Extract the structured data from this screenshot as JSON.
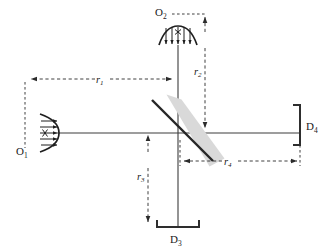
{
  "figure": {
    "background_color": "#ffffff",
    "line_color": "#3c3c3c",
    "beam_splitter_color": "#262626",
    "beam_splitter_band_color": "#d9d9d9",
    "dimension_color": "#2b2b2b"
  },
  "sources": [
    {
      "id": "source-o1",
      "label": "O",
      "subscript": "1",
      "position": "left",
      "emits": "right",
      "marker": "x"
    },
    {
      "id": "source-o2",
      "label": "O",
      "subscript": "2",
      "position": "top",
      "emits": "down",
      "marker": "x"
    }
  ],
  "detectors": [
    {
      "id": "detector-d3",
      "label": "D",
      "subscript": "3",
      "position": "bottom",
      "opening": "up"
    },
    {
      "id": "detector-d4",
      "label": "D",
      "subscript": "4",
      "position": "right",
      "opening": "left"
    }
  ],
  "beam_splitter": {
    "id": "beam-splitter",
    "orientation": "diagonal",
    "angle_degrees": 45
  },
  "dimensions": [
    {
      "id": "dim-r1",
      "label": "r",
      "subscript": "1",
      "orientation": "horizontal",
      "from": "source-o1",
      "to": "beam-splitter"
    },
    {
      "id": "dim-r2",
      "label": "r",
      "subscript": "2",
      "orientation": "vertical",
      "from": "source-o2",
      "to": "beam-splitter"
    },
    {
      "id": "dim-r3",
      "label": "r",
      "subscript": "3",
      "orientation": "vertical",
      "from": "beam-splitter",
      "to": "detector-d3"
    },
    {
      "id": "dim-r4",
      "label": "r",
      "subscript": "4",
      "orientation": "horizontal",
      "from": "beam-splitter",
      "to": "detector-d4"
    }
  ]
}
